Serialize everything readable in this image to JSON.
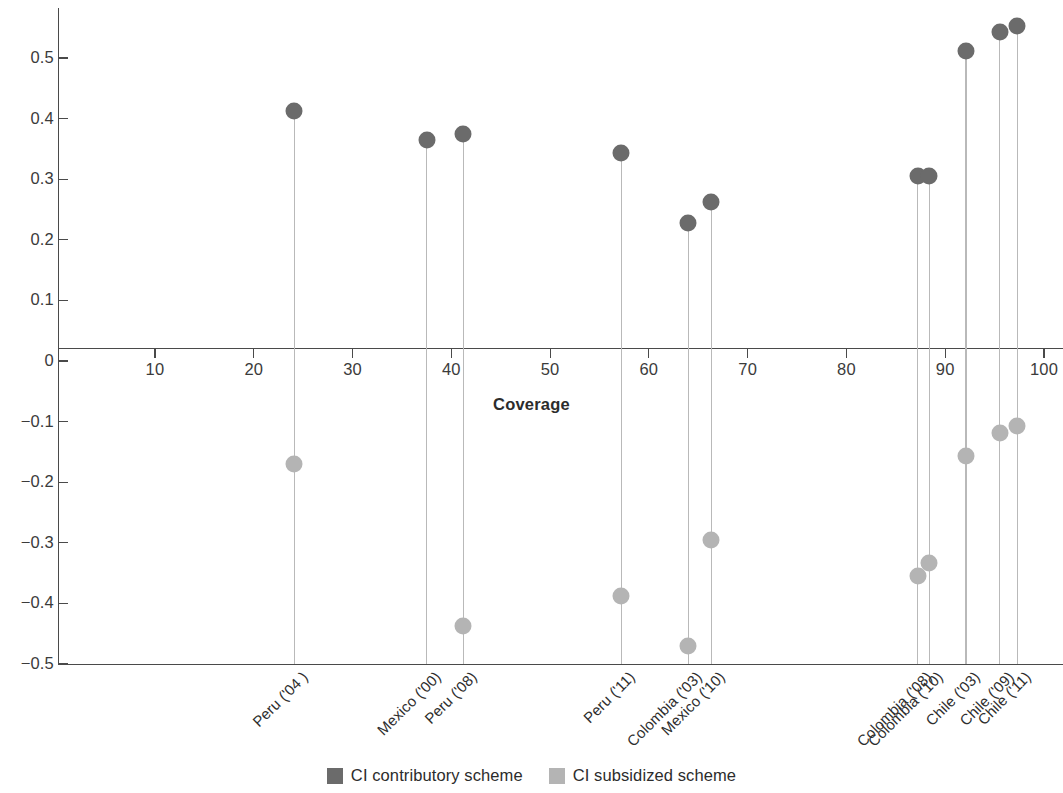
{
  "chart_data": {
    "type": "scatter",
    "title": "",
    "xlabel": "Coverage",
    "ylabel": "",
    "xlim": [
      5.3,
      101.0
    ],
    "ylim": [
      -0.5,
      0.558
    ],
    "grid": false,
    "legend_position": "bottom-center",
    "x_ticks": [
      10,
      20,
      30,
      40,
      50,
      60,
      70,
      80,
      90,
      100
    ],
    "x_tick_labels": [
      "10",
      "20",
      "30",
      "40",
      "50",
      "60",
      "70",
      "80",
      "90",
      "100"
    ],
    "y_ticks": [
      0.5,
      0.4,
      0.3,
      0.2,
      0.1,
      0,
      -0.1,
      -0.2,
      -0.3,
      -0.4,
      -0.5
    ],
    "y_tick_labels": [
      "0.5",
      "0.4",
      "0.3",
      "0.2",
      "0.1",
      "0",
      "−0.1",
      "−0.2",
      "−0.3",
      "−0.4",
      "−0.5"
    ],
    "categories": [
      "Peru ('04 )",
      "Mexico ('00)",
      "Peru ('08)",
      "Peru ('11)",
      "Colombia ('03)",
      "Mexico ('10)",
      "Colombia ('08)",
      "Colombia ('10)",
      "Chile ('03)",
      "Chile ('09)",
      "Chile ('11)"
    ],
    "x": [
      24.1,
      37.5,
      41.2,
      57.2,
      64.0,
      66.3,
      87.2,
      88.4,
      92.1,
      95.5,
      97.3
    ],
    "series": [
      {
        "name": "CI contributory scheme",
        "color": "#6b6b6b",
        "values": [
          0.413,
          0.365,
          0.374,
          0.343,
          0.228,
          0.263,
          0.306,
          0.306,
          0.512,
          0.543,
          0.553
        ]
      },
      {
        "name": "CI subsidized scheme",
        "color": "#b4b4b4",
        "values": [
          -0.17,
          null,
          -0.437,
          -0.388,
          -0.47,
          -0.296,
          -0.355,
          -0.333,
          -0.156,
          -0.119,
          -0.108
        ]
      }
    ]
  },
  "legend": {
    "entries": [
      {
        "label": "CI contributory scheme",
        "swatch": "contributory"
      },
      {
        "label": "CI subsidized scheme",
        "swatch": "subsidized"
      }
    ]
  },
  "axis": {
    "x_title": "Coverage"
  }
}
